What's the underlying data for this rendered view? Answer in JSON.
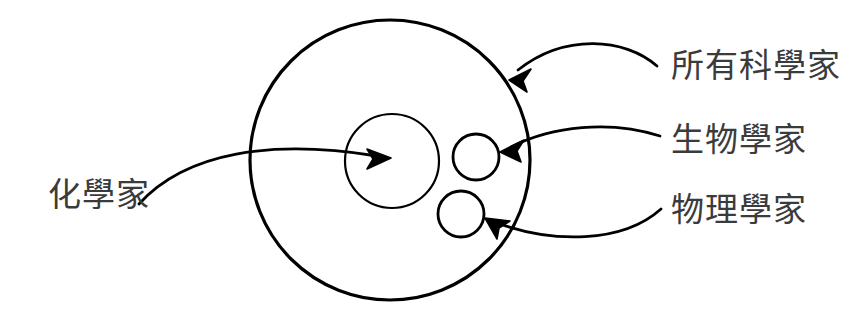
{
  "diagram": {
    "type": "venn-set-diagram",
    "background_color": "#ffffff",
    "stroke_color": "#000000",
    "text_color": "#3b3b3b",
    "title": "",
    "sets": [
      {
        "id": "all-scientists",
        "label": "所有科學家",
        "shape": "circle",
        "center_x": 390,
        "center_y": 160,
        "radius": 140,
        "stroke_width": 3,
        "fill": "none",
        "relation": "outer set containing all others"
      },
      {
        "id": "chemists",
        "label": "化學家",
        "shape": "circle",
        "center_x": 392,
        "center_y": 161,
        "radius": 47,
        "stroke_width": 2,
        "fill": "none",
        "relation": "subset of 所有科學家"
      },
      {
        "id": "biologists",
        "label": "生物學家",
        "shape": "circle",
        "center_x": 476,
        "center_y": 157,
        "radius": 23,
        "stroke_width": 2.6,
        "fill": "none",
        "relation": "subset of 所有科學家"
      },
      {
        "id": "physicists",
        "label": "物理學家",
        "shape": "circle",
        "center_x": 461,
        "center_y": 214,
        "radius": 23,
        "stroke_width": 2.6,
        "fill": "none",
        "relation": "subset of 所有科學家"
      }
    ],
    "callouts": [
      {
        "id": "callout-all-scientists",
        "label": "所有科學家",
        "label_x": 671,
        "label_y": 49,
        "points_to": "all-scientists",
        "arrow_tip_x": 510,
        "arrow_tip_y": 80
      },
      {
        "id": "callout-biologists",
        "label": "生物學家",
        "label_x": 671,
        "label_y": 123,
        "points_to": "biologists",
        "arrow_tip_x": 501,
        "arrow_tip_y": 151
      },
      {
        "id": "callout-physicists",
        "label": "物理學家",
        "label_x": 671,
        "label_y": 193,
        "points_to": "physicists",
        "arrow_tip_x": 486,
        "arrow_tip_y": 218
      },
      {
        "id": "callout-chemists",
        "label": "化學家",
        "label_x": 48,
        "label_y": 178,
        "points_to": "chemists",
        "arrow_tip_x": 390,
        "arrow_tip_y": 158
      }
    ]
  }
}
